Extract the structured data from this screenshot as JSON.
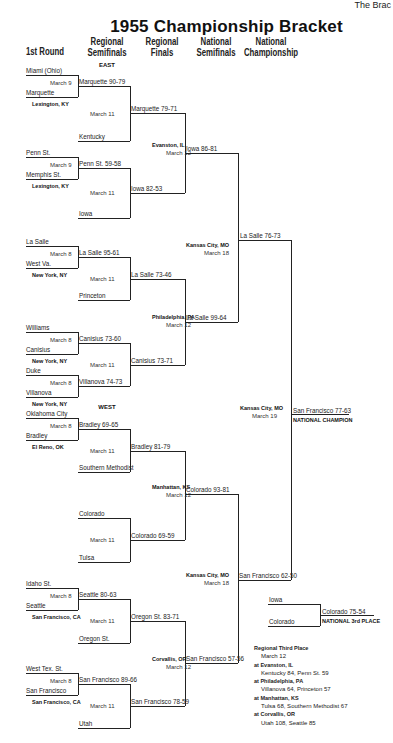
{
  "corner_text": "The Brac",
  "title": "1955 Championship Bracket",
  "headers": [
    "1st Round",
    "Regional Semifinals",
    "Regional Finals",
    "National Semifinals",
    "National Championship"
  ],
  "regions": {
    "east": "EAST",
    "west": "WEST"
  },
  "first_round": [
    {
      "top": "Miami (Ohio)",
      "date": "March 9",
      "bottom": "Marquette",
      "site": "Lexington, KY"
    },
    {
      "top": "Penn St.",
      "date": "March 9",
      "bottom": "Memphis St.",
      "site": "Lexington, KY"
    },
    {
      "top": "La Salle",
      "date": "March 8",
      "bottom": "West Va.",
      "site": "New York, NY"
    },
    {
      "top": "Williams",
      "date": "March 8",
      "bottom": "Canisius",
      "site": "New York, NY"
    },
    {
      "top": "Duke",
      "date": "March 8",
      "bottom": "Villanova",
      "site": "New York, NY"
    },
    {
      "top": "Oklahoma City",
      "date": "March 8",
      "bottom": "Bradley",
      "site": "El Reno, OK"
    },
    {
      "top": "Idaho St.",
      "date": "March 8",
      "bottom": "Seattle",
      "site": "San Francisco, CA"
    },
    {
      "top": "West Tex. St.",
      "date": "March 8",
      "bottom": "San Francisco",
      "site": "San Francisco, CA"
    }
  ],
  "regional_semifinals": [
    {
      "top": "Marquette 90-79",
      "date": "March 11",
      "bottom": "Kentucky"
    },
    {
      "top": "Penn St. 59-58",
      "date": "March 11",
      "bottom": "Iowa"
    },
    {
      "top": "La Salle 95-61",
      "date": "March 11",
      "bottom": "Princeton"
    },
    {
      "top": "Canisius 73-60",
      "date": "March 11",
      "bottom": "Villanova 74-73"
    },
    {
      "top": "Bradley 69-65",
      "date": "March 11",
      "bottom": "Southern Methodist"
    },
    {
      "top": "Colorado",
      "date": "March 11",
      "bottom": "Tulsa"
    },
    {
      "top": "Seattle 80-63",
      "date": "March 11",
      "bottom": "Oregon St."
    },
    {
      "top": "San Francisco 89-66",
      "date": "March 11",
      "bottom": "Utah"
    }
  ],
  "regional_finals": [
    {
      "top": "Marquette 79-71",
      "bottom": "Iowa 82-53",
      "site": "Evanston, IL",
      "date": "March 12"
    },
    {
      "top": "La Salle 73-46",
      "bottom": "Canisius 73-71",
      "site": "Philadelphia, PA",
      "date": "March 12"
    },
    {
      "top": "Bradley 81-79",
      "bottom": "Colorado 69-59",
      "site": "Manhattan, KS",
      "date": "March 12"
    },
    {
      "top": "Oregon St. 83-71",
      "bottom": "San Francisco 78-59",
      "site": "Corvallis, OR",
      "date": "March 12"
    }
  ],
  "national_semifinals": [
    {
      "top": "Iowa 86-81",
      "bottom": "La Salle 99-64",
      "site": "Kansas City, MO",
      "date": "March 18"
    },
    {
      "top": "Colorado 93-81",
      "bottom": "San Francisco 57-56",
      "site": "Kansas City, MO",
      "date": "March 18"
    }
  ],
  "national_championship": {
    "top": "La Salle 76-73",
    "bottom": "San Francisco 62-50",
    "site": "Kansas City, MO",
    "date": "March 19"
  },
  "champion": {
    "label": "San Francisco 77-63",
    "sub": "NATIONAL CHAMPION"
  },
  "third_place": {
    "top": "Iowa",
    "bottom": "Colorado",
    "result": "Colorado 75-54",
    "sub": "NATIONAL 3rd PLACE"
  },
  "regional_third_place": {
    "title": "Regional Third Place",
    "date": "March 12",
    "games": [
      {
        "site": "at Evanston, IL",
        "result": "Kentucky 84, Penn St. 59"
      },
      {
        "site": "at Philadelphia, PA",
        "result": "Villanova 64, Princeton 57"
      },
      {
        "site": "at Manhattan, KS",
        "result": "Tulsa 68, Southern Methodist 67"
      },
      {
        "site": "at Corvallis, OR",
        "result": "Utah 108, Seattle 85"
      }
    ]
  }
}
